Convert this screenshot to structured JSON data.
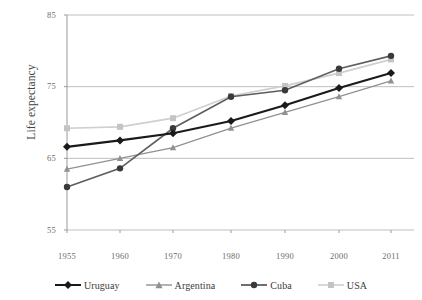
{
  "figure": {
    "top_caption_remnant": "",
    "background": "#ffffff"
  },
  "axes": {
    "ylabel": "Life expectancy",
    "xlabel": "",
    "yticks": [
      "85",
      "75",
      "65",
      "55"
    ],
    "xticks": [
      "1955",
      "1960",
      "1970",
      "1980",
      "1990",
      "2000",
      "2011"
    ],
    "gridline_color": "#bfbfbf",
    "axis_color": "#9a9a9a"
  },
  "legend": {
    "position": "bottom",
    "items": [
      {
        "label": "Uruguay",
        "color": "#1a1a1a",
        "marker": "diamond"
      },
      {
        "label": "Argentina",
        "color": "#919191",
        "marker": "triangle"
      },
      {
        "label": "Cuba",
        "color": "#5e5e5e",
        "marker": "circle"
      },
      {
        "label": "USA",
        "color": "#cfcfcf",
        "marker": "square"
      }
    ]
  },
  "chart_data": {
    "type": "line",
    "title": "",
    "xlabel": "",
    "ylabel": "Life expectancy",
    "categories": [
      "1955",
      "1960",
      "1970",
      "1980",
      "1990",
      "2000",
      "2011"
    ],
    "x": [
      1955,
      1960,
      1970,
      1980,
      1990,
      2000,
      2011
    ],
    "ylim": [
      55,
      85
    ],
    "yticks": [
      55,
      65,
      75,
      85
    ],
    "grid": "horizontal",
    "legend_position": "bottom",
    "series": [
      {
        "name": "Uruguay",
        "color": "#1a1a1a",
        "marker": "diamond",
        "values": [
          66.6,
          67.5,
          68.5,
          70.2,
          72.4,
          74.8,
          76.9
        ]
      },
      {
        "name": "Argentina",
        "color": "#919191",
        "marker": "triangle",
        "values": [
          63.5,
          65.0,
          66.5,
          69.2,
          71.4,
          73.6,
          75.8
        ]
      },
      {
        "name": "Cuba",
        "color": "#5e5e5e",
        "marker": "circle",
        "values": [
          61.0,
          63.6,
          69.2,
          73.6,
          74.5,
          77.5,
          79.3
        ]
      },
      {
        "name": "USA",
        "color": "#cfcfcf",
        "marker": "square",
        "values": [
          69.2,
          69.4,
          70.6,
          73.7,
          75.1,
          76.9,
          78.8
        ]
      }
    ]
  }
}
